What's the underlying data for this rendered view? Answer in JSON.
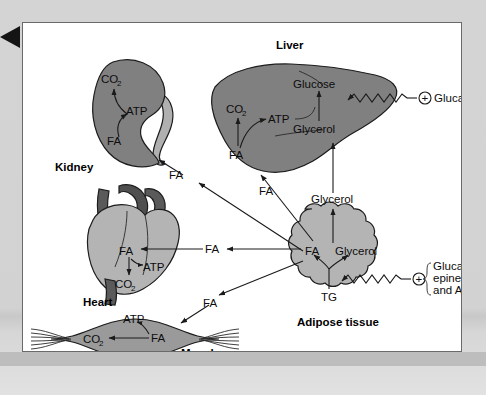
{
  "figure": {
    "caption_hidden": "",
    "corner_marker": "left-pointing-triangle"
  },
  "colors": {
    "organ_dark_gray": "#808080",
    "organ_mid_gray": "#9a9a9a",
    "organ_light_gray": "#b4b4b4",
    "vessel_dark_gray": "#5a5a5a",
    "panel_background": "#ffffff",
    "page_background": "#d4d4d4",
    "outline": "#1c1c1c"
  },
  "organs": {
    "kidney": {
      "name": "Kidney",
      "metabolites": {
        "co2": "CO",
        "co2_sub": "2",
        "atp": "ATP",
        "fa": "FA"
      }
    },
    "liver": {
      "name": "Liver",
      "metabolites": {
        "co2": "CO",
        "co2_sub": "2",
        "atp": "ATP",
        "fa": "FA",
        "glucose": "Glucose",
        "glycerol": "Glycerol"
      }
    },
    "heart": {
      "name": "Heart",
      "metabolites": {
        "fa": "FA",
        "atp": "ATP",
        "co2": "CO",
        "co2_sub": "2"
      }
    },
    "muscle": {
      "name": "Muscle",
      "metabolites": {
        "atp": "ATP",
        "fa": "FA",
        "co2": "CO",
        "co2_sub": "2"
      }
    },
    "adipose": {
      "name": "Adipose tissue",
      "metabolites": {
        "fa": "FA",
        "glycerol": "Glycerol",
        "tg": "TG"
      }
    }
  },
  "transport_labels": {
    "fa_to_kidney": "FA",
    "fa_to_liver": "FA",
    "fa_to_heart": "FA",
    "fa_to_muscle": "FA",
    "glycerol_to_liver": "Glycerol"
  },
  "hormones": {
    "liver_stimulus": {
      "sign": "+",
      "label": "Glucagon"
    },
    "adipose_stimulus": {
      "sign": "+",
      "line1": "Glucagon,",
      "line2": "epinephrine,",
      "line3": "and ACTH"
    }
  }
}
